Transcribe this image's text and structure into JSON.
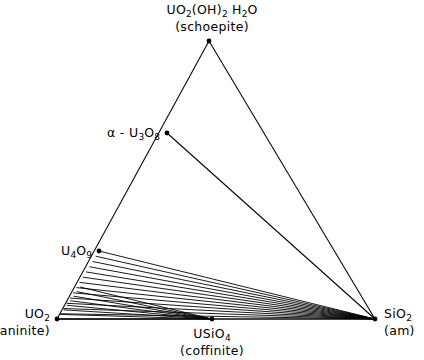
{
  "figure": {
    "type": "ternary-phase-diagram",
    "background_color": "#ffffff",
    "line_color": "#000000",
    "system": "UO2 - SiO2 - H2O"
  },
  "vertices": {
    "schoepite": {
      "formula_main": "UO",
      "formula_sub1": "2",
      "formula_mid": "(OH)",
      "formula_sub2": "2",
      "formula_tail": " H",
      "formula_sub3": "2",
      "formula_end": "O",
      "common_name": "(schoepite)",
      "x": 209,
      "y": 41
    },
    "uraninite": {
      "formula_main": "UO",
      "formula_sub1": "2",
      "common_name": "(uraninite)",
      "x": 57,
      "y": 319
    },
    "silica": {
      "formula_main": "SiO",
      "formula_sub1": "2",
      "common_name": "(am)",
      "x": 375,
      "y": 319
    }
  },
  "interior_points": {
    "alpha_u3o8": {
      "prefix": "α - U",
      "sub1": "3",
      "mid": "O",
      "sub2": "8",
      "x": 167,
      "y": 133
    },
    "u4o9": {
      "prefix": "U",
      "sub1": "4",
      "mid": "O",
      "sub2": "9",
      "x": 99,
      "y": 251
    },
    "coffinite": {
      "prefix": "USiO",
      "sub1": "4",
      "common_name": "(coffinite)",
      "x": 212,
      "y": 319
    }
  },
  "chart_data": {
    "type": "scatter",
    "title": "",
    "xlabel": "",
    "ylabel": "",
    "grid": false,
    "legend": "none",
    "points": [
      {
        "label": "UO2(OH)2 H2O",
        "common": "schoepite",
        "x": 209,
        "y": 41,
        "marker": "filled-circle"
      },
      {
        "label": "alpha-U3O8",
        "common": "",
        "x": 167,
        "y": 133,
        "marker": "filled-circle"
      },
      {
        "label": "U4O9",
        "common": "",
        "x": 99,
        "y": 251,
        "marker": "filled-circle"
      },
      {
        "label": "UO2",
        "common": "uraninite",
        "x": 57,
        "y": 319,
        "marker": "filled-circle"
      },
      {
        "label": "USiO4",
        "common": "coffinite",
        "x": 212,
        "y": 319,
        "marker": "filled-circle"
      },
      {
        "label": "SiO2",
        "common": "am",
        "x": 375,
        "y": 319,
        "marker": "filled-circle"
      }
    ],
    "edges": [
      {
        "from": "UO2(OH)2 H2O",
        "to": "UO2",
        "kind": "triangle-edge"
      },
      {
        "from": "UO2(OH)2 H2O",
        "to": "SiO2",
        "kind": "triangle-edge"
      },
      {
        "from": "UO2",
        "to": "SiO2",
        "kind": "triangle-edge"
      },
      {
        "from": "alpha-U3O8",
        "to": "SiO2",
        "kind": "tie-line"
      }
    ],
    "fan_to_sio2": {
      "description": "Tie-lines from evenly spaced compositions along the UO2 - U4O9 join converging on SiO2 (am).",
      "count": 14,
      "from_start": [
        99,
        251
      ],
      "from_end": [
        57,
        319
      ],
      "to": [
        375,
        319
      ]
    },
    "fan_to_usio4": {
      "description": "Tie-lines from compositions along the lower part of the UO2 - U4O9 join converging on USiO4 (coffinite).",
      "count": 8,
      "from_start": [
        80,
        287
      ],
      "from_end": [
        57,
        319
      ],
      "to": [
        212,
        319
      ]
    }
  }
}
